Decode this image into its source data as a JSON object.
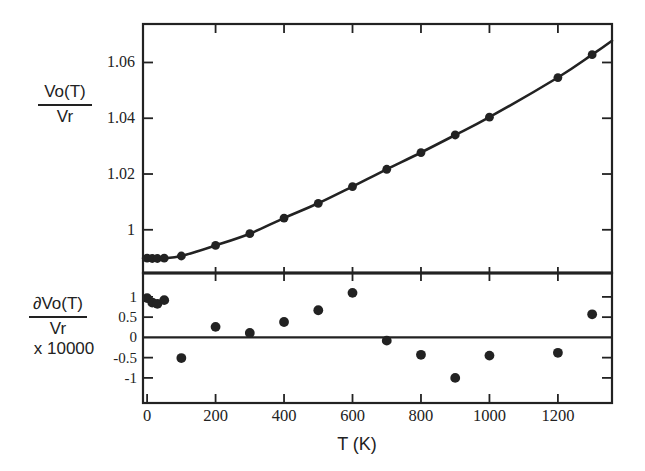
{
  "colors": {
    "ink": "#222222",
    "paper": "#ffffff"
  },
  "labels": {
    "top_axis": {
      "numerator": "Vo(T)",
      "denominator": "Vr"
    },
    "bottom_axis": {
      "numerator": "∂Vo(T)",
      "denominator": "Vr",
      "multiplier": "x 10000"
    },
    "x_axis": "T (K)"
  },
  "chart_data": [
    {
      "type": "scatter",
      "panel": "top",
      "name": "volume-ratio-vs-temperature",
      "ylabel": "Vo(T)/Vr",
      "xlabel": "T (K)",
      "marker": "filled-circle",
      "fit_curve": true,
      "x": [
        0,
        15,
        30,
        50,
        100,
        200,
        300,
        400,
        500,
        600,
        700,
        800,
        900,
        1000,
        1200,
        1300
      ],
      "y": [
        0.9898,
        0.9897,
        0.9897,
        0.9898,
        0.9906,
        0.9944,
        0.9986,
        1.0042,
        1.0095,
        1.0155,
        1.0217,
        1.0277,
        1.034,
        1.0404,
        1.0546,
        1.0628
      ],
      "fit_extension": {
        "x_start": -12,
        "y_start": 0.9898,
        "x_end": 1358,
        "y_end": 1.0678
      },
      "xlim": [
        -12,
        1358
      ],
      "ylim": [
        0.9845,
        1.0738
      ],
      "yticks": {
        "values": [
          1,
          1.02,
          1.04,
          1.06
        ],
        "labels": [
          "1",
          "1.02",
          "1.04",
          "1.06"
        ]
      },
      "xticks": {
        "values": [
          200,
          400,
          600,
          800,
          1000,
          1200
        ],
        "labels": []
      },
      "grid": false
    },
    {
      "type": "scatter",
      "panel": "bottom",
      "name": "fit-residuals-vs-temperature",
      "ylabel": "dVo(T)/Vr x 10000",
      "xlabel": "T (K)",
      "marker": "filled-circle",
      "zero_line": true,
      "x": [
        0,
        15,
        30,
        50,
        100,
        200,
        300,
        400,
        500,
        600,
        700,
        800,
        900,
        1000,
        1200,
        1300
      ],
      "y": [
        0.97,
        0.86,
        0.83,
        0.92,
        -0.51,
        0.26,
        0.11,
        0.38,
        0.67,
        1.1,
        -0.08,
        -0.43,
        -1.0,
        -0.45,
        -0.38,
        0.57
      ],
      "xlim": [
        -12,
        1358
      ],
      "ylim": [
        -1.62,
        1.59
      ],
      "yticks": {
        "values": [
          -1,
          -0.5,
          0,
          0.5,
          1
        ],
        "labels": [
          "-1",
          "-0.5",
          "0",
          "0.5",
          "1"
        ]
      },
      "xticks": {
        "values": [
          0,
          200,
          400,
          600,
          800,
          1000,
          1200
        ],
        "labels": [
          "0",
          "200",
          "400",
          "600",
          "800",
          "1000",
          "1200"
        ]
      },
      "grid": false
    }
  ]
}
